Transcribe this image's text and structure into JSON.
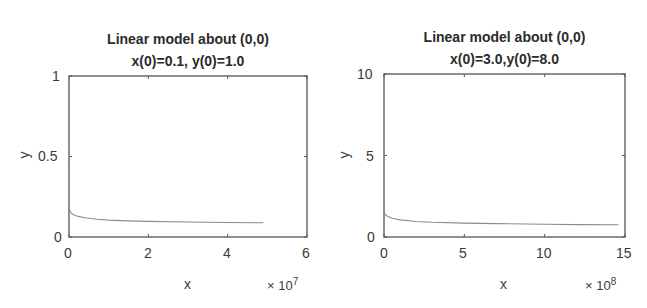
{
  "chart_data": [
    {
      "type": "line",
      "title": "Linear model about (0,0)",
      "subtitle": "x(0)=0.1, y(0)=1.0",
      "xlabel": "x",
      "ylabel": "y",
      "x_multiplier": "× 10^7",
      "xlim": [
        0,
        60000000.0
      ],
      "ylim": [
        0,
        1
      ],
      "xticks": [
        0,
        2,
        4,
        6
      ],
      "yticks": [
        "0",
        "0.5",
        "1"
      ],
      "grid": false,
      "legend": null,
      "series": [
        {
          "name": "trajectory",
          "color": "#8c8c8c",
          "x": [
            0,
            100000.0,
            500000.0,
            1000000.0,
            2000000.0,
            4000000.0,
            7000000.0,
            10000000.0,
            15000000.0,
            20000000.0,
            30000000.0,
            40000000.0,
            49000000.0
          ],
          "y": [
            1.0,
            0.17,
            0.15,
            0.14,
            0.13,
            0.12,
            0.11,
            0.105,
            0.1,
            0.097,
            0.093,
            0.09,
            0.088
          ]
        }
      ]
    },
    {
      "type": "line",
      "title": "Linear model about (0,0)",
      "subtitle": "x(0)=3.0,y(0)=8.0",
      "xlabel": "x",
      "ylabel": "y",
      "x_multiplier": "× 10^8",
      "xlim": [
        0,
        1500000000.0
      ],
      "ylim": [
        0,
        10
      ],
      "xticks": [
        0,
        5,
        10,
        15
      ],
      "yticks": [
        "0",
        "5",
        "10"
      ],
      "grid": false,
      "legend": null,
      "series": [
        {
          "name": "trajectory",
          "color": "#8c8c8c",
          "x": [
            0,
            2000000.0,
            10000000.0,
            25000000.0,
            50000000.0,
            100000000.0,
            200000000.0,
            300000000.0,
            500000000.0,
            700000000.0,
            1000000000.0,
            1200000000.0,
            1460000000.0
          ],
          "y": [
            8.0,
            1.5,
            1.35,
            1.25,
            1.15,
            1.05,
            0.95,
            0.9,
            0.85,
            0.82,
            0.78,
            0.76,
            0.75
          ]
        }
      ]
    }
  ],
  "panels": [
    {
      "title": "Linear model about (0,0)",
      "subtitle": "x(0)=0.1, y(0)=1.0",
      "xlabel": "x",
      "ylabel": "y",
      "x_exp_base": "× 10",
      "x_exp_power": "7",
      "xtick_labels": [
        "0",
        "2",
        "4",
        "6"
      ],
      "ytick_labels": [
        "0",
        "0.5",
        "1"
      ]
    },
    {
      "title": "Linear model about (0,0)",
      "subtitle": "x(0)=3.0,y(0)=8.0",
      "xlabel": "x",
      "ylabel": "y",
      "x_exp_base": "× 10",
      "x_exp_power": "8",
      "xtick_labels": [
        "0",
        "5",
        "10",
        "15"
      ],
      "ytick_labels": [
        "0",
        "5",
        "10"
      ]
    }
  ],
  "colors": {
    "axes": "#555555",
    "curve": "#8c8c8c",
    "text": "#3a3a3a"
  }
}
